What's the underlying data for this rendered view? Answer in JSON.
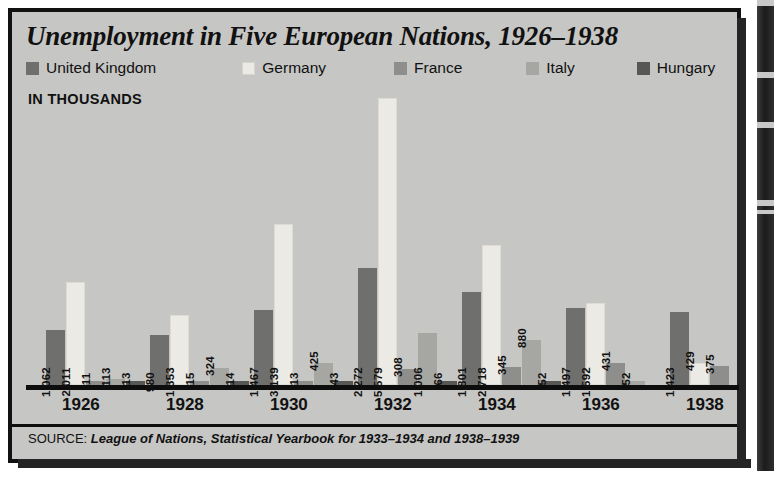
{
  "figure": {
    "title": "Unemployment in Five European Nations, 1926–1938",
    "units_label": "IN THOUSANDS",
    "source_keyword": "SOURCE:",
    "source_text": "League of Nations, Statistical Yearbook for 1933–1934 and 1938–1939"
  },
  "legend": {
    "items": [
      {
        "label": "United Kingdom",
        "color": "#6f6f6d",
        "swatch_name": "legend-swatch-united-kingdom"
      },
      {
        "label": "Germany",
        "color": "#eceae4",
        "swatch_name": "legend-swatch-germany"
      },
      {
        "label": "France",
        "color": "#8e8e8c",
        "swatch_name": "legend-swatch-france"
      },
      {
        "label": "Italy",
        "color": "#a6a6a3",
        "swatch_name": "legend-swatch-italy"
      },
      {
        "label": "Hungary",
        "color": "#575755",
        "swatch_name": "legend-swatch-hungary"
      }
    ]
  },
  "chart_data": {
    "type": "bar",
    "title": "Unemployment in Five European Nations, 1926–1938",
    "subtitle": "",
    "xlabel": "",
    "ylabel": "IN THOUSANDS",
    "units": "thousands",
    "ylim": [
      0,
      5579
    ],
    "grid": false,
    "legend_position": "top",
    "categories": [
      "1926",
      "1928",
      "1930",
      "1932",
      "1934",
      "1936",
      "1938"
    ],
    "series": [
      {
        "name": "United Kingdom",
        "color": "#6f6f6d",
        "values": [
          1062,
          980,
          1467,
          2272,
          1801,
          1497,
          1423
        ],
        "labels": [
          "1,062",
          "980",
          "1,467",
          "2,272",
          "1,801",
          "1,497",
          "1,423"
        ]
      },
      {
        "name": "Germany",
        "color": "#eceae4",
        "values": [
          2011,
          1353,
          3139,
          5579,
          2718,
          1592,
          429
        ],
        "labels": [
          "2,011",
          "1,353",
          "3,139",
          "5,579",
          "2,718",
          "1,592",
          "429"
        ]
      },
      {
        "name": "France",
        "color": "#8e8e8c",
        "values": [
          11,
          15,
          13,
          308,
          345,
          431,
          375
        ],
        "labels": [
          "11",
          "15",
          "13",
          "308",
          "345",
          "431",
          "375"
        ]
      },
      {
        "name": "Italy",
        "color": "#a6a6a3",
        "values": [
          113,
          324,
          425,
          1006,
          880,
          52,
          null
        ],
        "labels": [
          "113",
          "324",
          "425",
          "1,006",
          "880",
          "52",
          ""
        ]
      },
      {
        "name": "Hungary",
        "color": "#575755",
        "values": [
          13,
          14,
          43,
          66,
          52,
          null,
          null
        ],
        "labels": [
          "13",
          "14",
          "43",
          "66",
          "52",
          "",
          ""
        ]
      }
    ],
    "annotations": [
      "Values are printed vertically above/inside each bar.",
      "Italy and Hungary have no printed value for the final years shown."
    ]
  },
  "xticks": [
    "1926",
    "1928",
    "1930",
    "1932",
    "1934",
    "1936",
    "1938"
  ]
}
